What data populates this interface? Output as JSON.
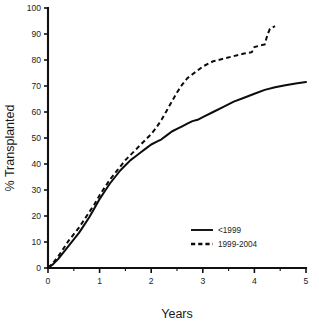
{
  "chart_data": {
    "type": "line",
    "title": "",
    "xlabel": "Years",
    "ylabel": "% Transplanted",
    "xlim": [
      0,
      5
    ],
    "ylim": [
      0,
      100
    ],
    "grid": false,
    "legend_position": "lower-right",
    "x_ticks": [
      0,
      1,
      2,
      3,
      4,
      5
    ],
    "x_tick_labels": [
      "0",
      "1",
      "2",
      "3",
      "4",
      "5"
    ],
    "x_minor_ticks": [
      0.5,
      1.5,
      2.5,
      3.5,
      4.5
    ],
    "y_ticks": [
      0,
      10,
      20,
      30,
      40,
      50,
      60,
      70,
      80,
      90,
      100
    ],
    "y_tick_labels": [
      "0",
      "10",
      "20",
      "30",
      "40",
      "50",
      "60",
      "70",
      "80",
      "90",
      "100"
    ],
    "series": [
      {
        "name": "<1999",
        "style": "solid",
        "color": "#0c0c0c",
        "x": [
          0,
          0.1,
          0.2,
          0.3,
          0.4,
          0.5,
          0.6,
          0.7,
          0.8,
          0.9,
          1.0,
          1.1,
          1.2,
          1.3,
          1.4,
          1.5,
          1.6,
          1.7,
          1.8,
          1.9,
          2.0,
          2.1,
          2.2,
          2.3,
          2.4,
          2.5,
          2.6,
          2.7,
          2.8,
          2.9,
          3.0,
          3.2,
          3.4,
          3.6,
          3.8,
          4.0,
          4.2,
          4.4,
          4.6,
          4.8,
          5.0
        ],
        "y": [
          0,
          1.5,
          3.5,
          6.0,
          8.5,
          11.0,
          13.5,
          16.5,
          19.5,
          23.0,
          26.5,
          29.5,
          32.5,
          35.0,
          37.5,
          39.5,
          41.5,
          43.0,
          44.5,
          46.0,
          47.5,
          48.5,
          49.5,
          51.0,
          52.5,
          53.5,
          54.5,
          55.5,
          56.5,
          57.0,
          58.0,
          60.0,
          62.0,
          64.0,
          65.5,
          67.0,
          68.5,
          69.5,
          70.3,
          71.0,
          71.5
        ]
      },
      {
        "name": "1999-2004",
        "style": "dashed",
        "color": "#0c0c0c",
        "x": [
          0,
          0.1,
          0.2,
          0.3,
          0.4,
          0.5,
          0.6,
          0.7,
          0.8,
          0.9,
          1.0,
          1.1,
          1.2,
          1.3,
          1.4,
          1.5,
          1.6,
          1.7,
          1.8,
          1.9,
          2.0,
          2.1,
          2.2,
          2.3,
          2.4,
          2.5,
          2.6,
          2.7,
          2.8,
          2.9,
          3.0,
          3.2,
          3.4,
          3.6,
          3.8,
          3.95,
          4.0,
          4.1,
          4.2,
          4.25,
          4.3,
          4.4
        ],
        "y": [
          0,
          2.0,
          4.5,
          7.5,
          10.5,
          13.0,
          15.5,
          18.5,
          21.5,
          24.5,
          28.0,
          31.0,
          34.0,
          36.5,
          39.0,
          41.5,
          43.5,
          45.5,
          47.5,
          49.5,
          51.5,
          54.0,
          57.0,
          60.5,
          64.0,
          67.5,
          70.5,
          73.0,
          74.5,
          76.0,
          77.5,
          79.5,
          80.5,
          81.5,
          82.5,
          83.0,
          85.0,
          85.5,
          86.0,
          89.5,
          92.0,
          93.0
        ]
      }
    ]
  },
  "legend": {
    "items": [
      {
        "label": "<1999",
        "style": "solid"
      },
      {
        "label": "1999-2004",
        "style": "dashed"
      }
    ]
  }
}
